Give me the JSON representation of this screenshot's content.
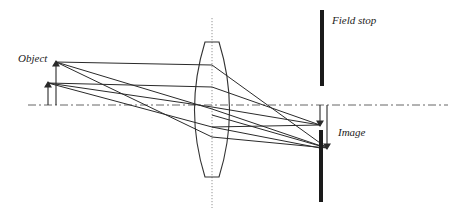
{
  "labels": {
    "object": "Object",
    "field_stop": "Field stop",
    "image": "Image"
  },
  "colors": {
    "line": "#2a2a2a",
    "axis": "#555555",
    "stop": "#1a1a1a",
    "background": "#ffffff"
  },
  "geometry": {
    "optical_axis_y": 105,
    "lens_center_x": 212,
    "lens_top_y": 42,
    "lens_bottom_y": 177,
    "object_arrows": [
      {
        "x": 56,
        "tip_y": 62
      },
      {
        "x": 48,
        "tip_y": 83
      }
    ],
    "image_arrows": [
      {
        "x": 320,
        "tip_y": 125
      },
      {
        "x": 327,
        "tip_y": 148
      }
    ],
    "field_stop": {
      "x": 322,
      "upper": [
        10,
        86
      ],
      "lower": [
        130,
        202
      ]
    }
  }
}
